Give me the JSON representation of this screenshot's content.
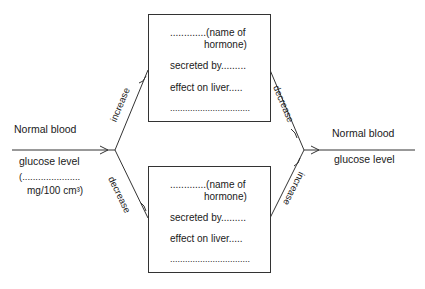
{
  "left_state": {
    "line1": "Normal blood",
    "line2": "glucose level",
    "line3": "(......................",
    "line4": "mg/100 cm³)"
  },
  "right_state": {
    "line1": "Normal blood",
    "line2": "glucose level"
  },
  "arrows": {
    "left_up": "increase",
    "left_down": "decrease",
    "right_from_top": "decrease",
    "right_from_bottom": "increase"
  },
  "top_box": {
    "line1": ".............(name of",
    "line2": "hormone)",
    "line3": "secreted by.........",
    "line4": "effect on liver.....",
    "line5": "................................"
  },
  "bottom_box": {
    "line1": ".............(name of",
    "line2": "hormone)",
    "line3": "secreted by.........",
    "line4": "effect on liver.....",
    "line5": "................................"
  }
}
